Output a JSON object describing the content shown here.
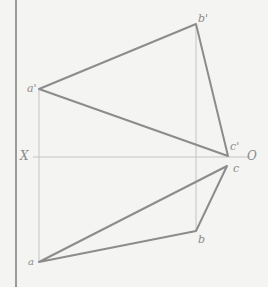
{
  "diagram": {
    "type": "orthographic projection (plane triangle)",
    "axis": {
      "left_label": "X",
      "right_label": "O"
    },
    "points": {
      "a_prime": {
        "label": "a'",
        "x": 39,
        "y": 89
      },
      "b_prime": {
        "label": "b'",
        "x": 196,
        "y": 24
      },
      "c_prime": {
        "label": "c'",
        "x": 228,
        "y": 156
      },
      "a": {
        "label": "a",
        "x": 39,
        "y": 262
      },
      "b": {
        "label": "b",
        "x": 196,
        "y": 231
      },
      "c": {
        "label": "c",
        "x": 227,
        "y": 166
      }
    },
    "colors": {
      "background": "#f4f4f2",
      "edge": "#8c8c8c",
      "projector": "#c4c4c4",
      "border": "#9a9a9a",
      "label": "#8a8a8a"
    }
  }
}
